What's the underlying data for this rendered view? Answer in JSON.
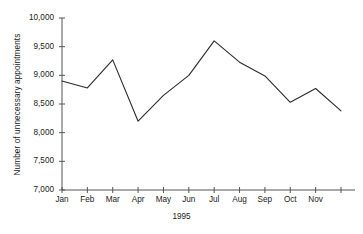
{
  "chart_data": {
    "type": "line",
    "title": "",
    "subtitle": "",
    "xlabel": "1995",
    "ylabel": "Number of unnecessary appointments",
    "categories": [
      "Jan",
      "Feb",
      "Mar",
      "Apr",
      "May",
      "Jun",
      "Jul",
      "Aug",
      "Sep",
      "Oct",
      "Nov",
      "Dec"
    ],
    "x_tick_labels": [
      "Jan",
      "Feb",
      "Mar",
      "Apr",
      "May",
      "Jun",
      "Jul",
      "Aug",
      "Sep",
      "Oct",
      "Nov",
      ""
    ],
    "values": [
      8900,
      8780,
      9270,
      8200,
      8650,
      9000,
      9600,
      9230,
      8990,
      8530,
      8770,
      8380
    ],
    "y_tick_labels": [
      "10,000",
      "9,500",
      "9,000",
      "8,500",
      "8,000",
      "7,500",
      "7,000"
    ],
    "y_ticks": [
      10000,
      9500,
      9000,
      8500,
      8000,
      7500,
      7000
    ],
    "ylim": [
      7000,
      10000
    ],
    "grid": false,
    "legend": null,
    "line_color": "#2b2b2b",
    "axis_color": "#555555",
    "background_color": "#ffffff",
    "series": [
      {
        "name": "Number of unnecessary appointments",
        "values": [
          8900,
          8780,
          9270,
          8200,
          8650,
          9000,
          9600,
          9230,
          8990,
          8530,
          8770,
          8380
        ]
      }
    ]
  }
}
